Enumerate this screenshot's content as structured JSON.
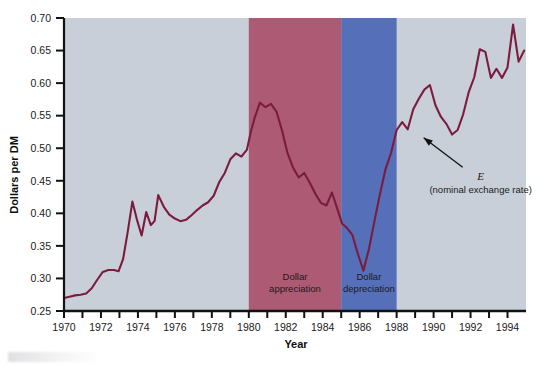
{
  "chart_data": {
    "type": "line",
    "title": "",
    "xlabel": "Year",
    "ylabel": "Dollars per DM",
    "xlim": [
      1970,
      1995
    ],
    "ylim": [
      0.25,
      0.7
    ],
    "grid": false,
    "legend": "none",
    "y_ticks": [
      "0.25",
      "0.30",
      "0.35",
      "0.40",
      "0.45",
      "0.50",
      "0.55",
      "0.60",
      "0.65",
      "0.70"
    ],
    "y_tick_values": [
      0.25,
      0.3,
      0.35,
      0.4,
      0.45,
      0.5,
      0.55,
      0.6,
      0.65,
      0.7
    ],
    "x_ticks_labeled": [
      "1970",
      "1972",
      "1974",
      "1976",
      "1978",
      "1980",
      "1982",
      "1984",
      "1986",
      "1988",
      "1990",
      "1992",
      "1994"
    ],
    "x_tick_values_labeled": [
      1970,
      1972,
      1974,
      1976,
      1978,
      1980,
      1982,
      1984,
      1986,
      1988,
      1990,
      1992,
      1994
    ],
    "x_tick_values_minor": [
      1971,
      1973,
      1975,
      1977,
      1979,
      1981,
      1983,
      1985,
      1987,
      1989,
      1991,
      1993
    ],
    "series": [
      {
        "name": "E (nominal exchange rate)",
        "color": "#7B1C3E",
        "x": [
          1970.0,
          1970.3,
          1970.6,
          1970.9,
          1971.2,
          1971.5,
          1971.8,
          1972.1,
          1972.4,
          1972.7,
          1972.95,
          1973.2,
          1973.45,
          1973.7,
          1973.95,
          1974.2,
          1974.45,
          1974.7,
          1974.9,
          1975.1,
          1975.4,
          1975.7,
          1976.0,
          1976.3,
          1976.6,
          1976.9,
          1977.2,
          1977.5,
          1977.8,
          1978.1,
          1978.4,
          1978.7,
          1979.0,
          1979.3,
          1979.6,
          1979.9,
          1980.1,
          1980.3,
          1980.6,
          1980.9,
          1981.2,
          1981.5,
          1981.8,
          1982.1,
          1982.4,
          1982.7,
          1983.0,
          1983.3,
          1983.6,
          1983.9,
          1984.2,
          1984.5,
          1984.8,
          1985.05,
          1985.3,
          1985.6,
          1985.9,
          1986.2,
          1986.5,
          1986.8,
          1987.1,
          1987.4,
          1987.7,
          1988.0,
          1988.3,
          1988.6,
          1988.9,
          1989.2,
          1989.5,
          1989.8,
          1990.1,
          1990.4,
          1990.7,
          1991.0,
          1991.3,
          1991.6,
          1991.9,
          1992.2,
          1992.5,
          1992.8,
          1993.1,
          1993.4,
          1993.7,
          1994.0,
          1994.3,
          1994.6,
          1994.9
        ],
        "y": [
          0.27,
          0.272,
          0.274,
          0.275,
          0.277,
          0.285,
          0.298,
          0.31,
          0.313,
          0.313,
          0.311,
          0.33,
          0.372,
          0.418,
          0.39,
          0.366,
          0.402,
          0.382,
          0.388,
          0.428,
          0.41,
          0.398,
          0.392,
          0.388,
          0.39,
          0.397,
          0.405,
          0.412,
          0.417,
          0.427,
          0.448,
          0.462,
          0.483,
          0.492,
          0.487,
          0.498,
          0.524,
          0.545,
          0.57,
          0.563,
          0.568,
          0.556,
          0.527,
          0.492,
          0.47,
          0.455,
          0.462,
          0.447,
          0.43,
          0.416,
          0.412,
          0.432,
          0.406,
          0.384,
          0.378,
          0.367,
          0.338,
          0.312,
          0.345,
          0.388,
          0.43,
          0.468,
          0.493,
          0.528,
          0.54,
          0.529,
          0.56,
          0.576,
          0.59,
          0.597,
          0.566,
          0.548,
          0.537,
          0.521,
          0.528,
          0.552,
          0.586,
          0.609,
          0.652,
          0.648,
          0.608,
          0.622,
          0.608,
          0.624,
          0.69,
          0.633,
          0.65
        ]
      }
    ],
    "shaded_regions": [
      {
        "label": "Dollar appreciation",
        "label_line1": "Dollar",
        "label_line2": "appreciation",
        "x_start": 1980,
        "x_end": 1985,
        "color": "#AD5A75"
      },
      {
        "label": "Dollar depreciation",
        "label_line1": "Dollar",
        "label_line2": "depreciation",
        "x_start": 1985,
        "x_end": 1988,
        "color": "#5570B8"
      }
    ],
    "annotations": [
      {
        "symbol": "E",
        "description": "(nominal exchange rate)",
        "points_to_x": 1989.3,
        "points_to_y": 0.52
      }
    ],
    "plot_background": "#C9CFD8",
    "axis_color": "#111111"
  }
}
